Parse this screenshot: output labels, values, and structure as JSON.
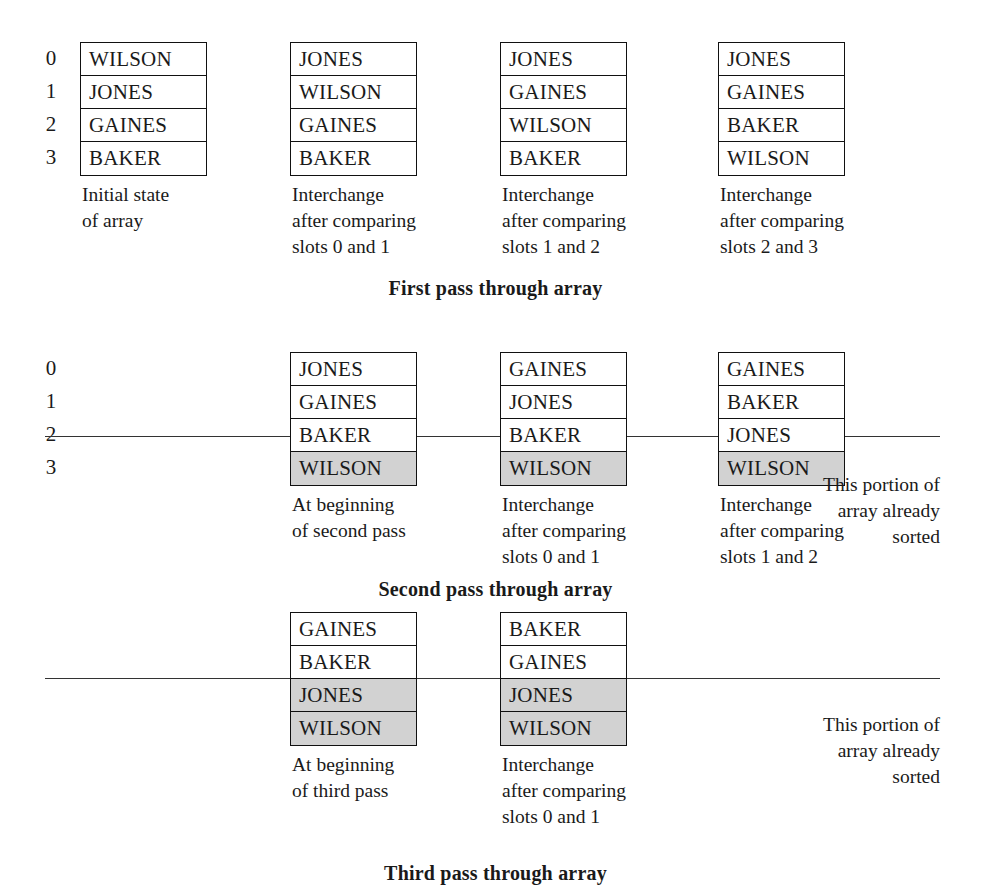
{
  "figure": {
    "names": [
      "WILSON",
      "JONES",
      "GAINES",
      "BAKER"
    ],
    "row_indices": [
      "0",
      "1",
      "2",
      "3"
    ],
    "shade_color": "#d2d2d2",
    "sorted_note": "This portion of\narray already\nsorted"
  },
  "passes": [
    {
      "id": "first-pass",
      "title": "First pass through array",
      "show_indices": true,
      "divider": false,
      "sorted_note": null,
      "snapshots": [
        {
          "cells": [
            "WILSON",
            "JONES",
            "GAINES",
            "BAKER"
          ],
          "shaded": [
            false,
            false,
            false,
            false
          ],
          "caption": "Initial state\nof array"
        },
        {
          "cells": [
            "JONES",
            "WILSON",
            "GAINES",
            "BAKER"
          ],
          "shaded": [
            false,
            false,
            false,
            false
          ],
          "caption": "Interchange\nafter comparing\nslots 0 and 1"
        },
        {
          "cells": [
            "JONES",
            "GAINES",
            "WILSON",
            "BAKER"
          ],
          "shaded": [
            false,
            false,
            false,
            false
          ],
          "caption": "Interchange\nafter comparing\nslots 1 and 2"
        },
        {
          "cells": [
            "JONES",
            "GAINES",
            "BAKER",
            "WILSON"
          ],
          "shaded": [
            false,
            false,
            false,
            false
          ],
          "caption": "Interchange\nafter comparing\nslots 2 and 3"
        }
      ]
    },
    {
      "id": "second-pass",
      "title": "Second pass through array",
      "show_indices": true,
      "divider": true,
      "sorted_note": "This portion of\narray already\nsorted",
      "snapshots": [
        {
          "cells": [
            "JONES",
            "GAINES",
            "BAKER",
            "WILSON"
          ],
          "shaded": [
            false,
            false,
            false,
            true
          ],
          "caption": "At beginning\nof second pass"
        },
        {
          "cells": [
            "GAINES",
            "JONES",
            "BAKER",
            "WILSON"
          ],
          "shaded": [
            false,
            false,
            false,
            true
          ],
          "caption": "Interchange\nafter comparing\nslots 0 and 1"
        },
        {
          "cells": [
            "GAINES",
            "BAKER",
            "JONES",
            "WILSON"
          ],
          "shaded": [
            false,
            false,
            false,
            true
          ],
          "caption": "Interchange\nafter comparing\nslots 1 and 2"
        }
      ]
    },
    {
      "id": "third-pass",
      "title": "Third pass through array",
      "show_indices": false,
      "divider": true,
      "sorted_note": "This portion of\narray already\nsorted",
      "snapshots": [
        {
          "cells": [
            "GAINES",
            "BAKER",
            "JONES",
            "WILSON"
          ],
          "shaded": [
            false,
            false,
            true,
            true
          ],
          "caption": "At beginning\nof third pass"
        },
        {
          "cells": [
            "BAKER",
            "GAINES",
            "JONES",
            "WILSON"
          ],
          "shaded": [
            false,
            false,
            true,
            true
          ],
          "caption": "Interchange\nafter comparing\nslots 0 and 1"
        }
      ]
    }
  ]
}
